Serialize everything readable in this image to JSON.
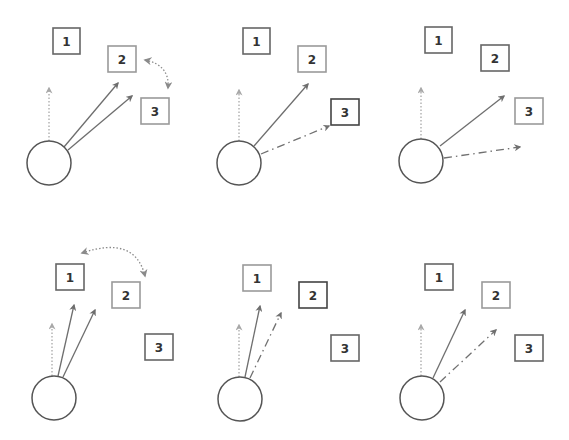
{
  "diagram": {
    "title": "",
    "colors": {
      "background": "#ffffff",
      "box_dark": "#444444",
      "box_normal": "#666666",
      "box_light": "#9a9a9a",
      "arrow_solid": "#6e6e6e",
      "arrow_dotted": "#a8a8a8",
      "arrow_dashdot": "#707070",
      "swap_arrow": "#8a8a8a",
      "circle": "#555555",
      "label": "#333333"
    },
    "panels": [
      {
        "id": "panel-1",
        "circle": {
          "cx": 49,
          "cy": 163,
          "r": 22
        },
        "boxes": [
          {
            "label": "1",
            "x": 53,
            "y": 28,
            "w": 27,
            "h": 26,
            "tone": "normal"
          },
          {
            "label": "2",
            "x": 108,
            "y": 46,
            "w": 28,
            "h": 26,
            "tone": "light"
          },
          {
            "label": "3",
            "x": 141,
            "y": 98,
            "w": 28,
            "h": 26,
            "tone": "light"
          }
        ],
        "arrows": [
          {
            "style": "dotted",
            "x1": 49,
            "y1": 141,
            "x2": 49,
            "y2": 88
          },
          {
            "style": "solid",
            "x1": 64,
            "y1": 147,
            "x2": 118,
            "y2": 83
          },
          {
            "style": "solid",
            "x1": 68,
            "y1": 150,
            "x2": 132,
            "y2": 96
          }
        ],
        "swap": {
          "x1": 145,
          "y1": 60,
          "cx": 170,
          "cy": 65,
          "x2": 168,
          "y2": 88,
          "between": [
            "2",
            "3"
          ]
        }
      },
      {
        "id": "panel-2",
        "circle": {
          "cx": 239,
          "cy": 163,
          "r": 22
        },
        "boxes": [
          {
            "label": "1",
            "x": 243,
            "y": 28,
            "w": 27,
            "h": 26,
            "tone": "normal"
          },
          {
            "label": "2",
            "x": 298,
            "y": 46,
            "w": 28,
            "h": 26,
            "tone": "light"
          },
          {
            "label": "3",
            "x": 331,
            "y": 99,
            "w": 28,
            "h": 26,
            "tone": "dark"
          }
        ],
        "arrows": [
          {
            "style": "dotted",
            "x1": 239,
            "y1": 141,
            "x2": 239,
            "y2": 90
          },
          {
            "style": "solid",
            "x1": 254,
            "y1": 146,
            "x2": 308,
            "y2": 84
          },
          {
            "style": "dashdot",
            "x1": 261,
            "y1": 154,
            "x2": 329,
            "y2": 126
          }
        ],
        "swap": null
      },
      {
        "id": "panel-3",
        "circle": {
          "cx": 421,
          "cy": 161,
          "r": 22
        },
        "boxes": [
          {
            "label": "1",
            "x": 425,
            "y": 27,
            "w": 27,
            "h": 26,
            "tone": "normal"
          },
          {
            "label": "2",
            "x": 481,
            "y": 45,
            "w": 28,
            "h": 26,
            "tone": "normal"
          },
          {
            "label": "3",
            "x": 515,
            "y": 98,
            "w": 28,
            "h": 26,
            "tone": "light"
          }
        ],
        "arrows": [
          {
            "style": "dotted",
            "x1": 421,
            "y1": 139,
            "x2": 421,
            "y2": 88
          },
          {
            "style": "solid",
            "x1": 440,
            "y1": 146,
            "x2": 504,
            "y2": 96
          },
          {
            "style": "dashdot",
            "x1": 444,
            "y1": 158,
            "x2": 520,
            "y2": 147
          }
        ],
        "swap": null
      },
      {
        "id": "panel-4",
        "circle": {
          "cx": 54,
          "cy": 398,
          "r": 22
        },
        "boxes": [
          {
            "label": "1",
            "x": 56,
            "y": 264,
            "w": 28,
            "h": 26,
            "tone": "normal"
          },
          {
            "label": "2",
            "x": 112,
            "y": 282,
            "w": 28,
            "h": 26,
            "tone": "light"
          },
          {
            "label": "3",
            "x": 145,
            "y": 334,
            "w": 28,
            "h": 26,
            "tone": "normal"
          }
        ],
        "arrows": [
          {
            "style": "dotted",
            "x1": 52,
            "y1": 376,
            "x2": 52,
            "y2": 324
          },
          {
            "style": "solid",
            "x1": 58,
            "y1": 376,
            "x2": 74,
            "y2": 305
          },
          {
            "style": "solid",
            "x1": 63,
            "y1": 377,
            "x2": 95,
            "y2": 310
          }
        ],
        "swap": {
          "x1": 82,
          "y1": 253,
          "cx": 135,
          "cy": 235,
          "x2": 145,
          "y2": 276,
          "between": [
            "1",
            "2"
          ]
        }
      },
      {
        "id": "panel-5",
        "circle": {
          "cx": 240,
          "cy": 399,
          "r": 22
        },
        "boxes": [
          {
            "label": "1",
            "x": 243,
            "y": 265,
            "w": 28,
            "h": 26,
            "tone": "light"
          },
          {
            "label": "2",
            "x": 299,
            "y": 282,
            "w": 28,
            "h": 26,
            "tone": "dark"
          },
          {
            "label": "3",
            "x": 331,
            "y": 335,
            "w": 28,
            "h": 26,
            "tone": "normal"
          }
        ],
        "arrows": [
          {
            "style": "dotted",
            "x1": 239,
            "y1": 377,
            "x2": 239,
            "y2": 325
          },
          {
            "style": "solid",
            "x1": 245,
            "y1": 377,
            "x2": 260,
            "y2": 306
          },
          {
            "style": "dashdot",
            "x1": 250,
            "y1": 378,
            "x2": 281,
            "y2": 313
          }
        ],
        "swap": null
      },
      {
        "id": "panel-6",
        "circle": {
          "cx": 422,
          "cy": 398,
          "r": 22
        },
        "boxes": [
          {
            "label": "1",
            "x": 425,
            "y": 264,
            "w": 28,
            "h": 26,
            "tone": "normal"
          },
          {
            "label": "2",
            "x": 482,
            "y": 282,
            "w": 28,
            "h": 26,
            "tone": "light"
          },
          {
            "label": "3",
            "x": 515,
            "y": 335,
            "w": 28,
            "h": 26,
            "tone": "normal"
          }
        ],
        "arrows": [
          {
            "style": "dotted",
            "x1": 421,
            "y1": 376,
            "x2": 421,
            "y2": 325
          },
          {
            "style": "solid",
            "x1": 433,
            "y1": 378,
            "x2": 465,
            "y2": 310
          },
          {
            "style": "dashdot",
            "x1": 440,
            "y1": 382,
            "x2": 496,
            "y2": 330
          }
        ],
        "swap": null
      }
    ]
  }
}
